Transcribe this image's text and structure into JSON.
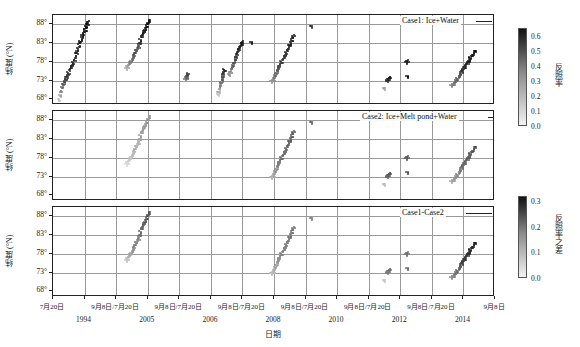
{
  "figure": {
    "xaxis_title": "日期",
    "yaxis_title": "纬度 (°N)"
  },
  "panels": [
    {
      "id": "panel-1",
      "label": "Case1: Ice+Water"
    },
    {
      "id": "panel-2",
      "label": "Case2: Ice+Melt pond+Water"
    },
    {
      "id": "panel-3",
      "label": "Case1-Case2"
    }
  ],
  "yticks": [
    "68°",
    "73°",
    "78°",
    "83°",
    "88°"
  ],
  "ytick_values": [
    68,
    73,
    78,
    83,
    88
  ],
  "xticks": [
    "7月20日",
    "9月8日",
    "7月20日",
    "9月8日",
    "7月20日",
    "9月8日",
    "7月20日",
    "9月8日",
    "7月20日",
    "9月8日",
    "7月20日",
    "9月8日",
    "7月20日",
    "9月8日"
  ],
  "xtick_groups": [
    "7月20日",
    "9月8日/7月20日",
    "9月8日/7月20日",
    "9月8日/7月20日",
    "9月8日/7月20日",
    "9月8日/7月20日",
    "9月8日/7月20日",
    "9月8日"
  ],
  "years": [
    "1994",
    "2005",
    "2006",
    "2008",
    "2010",
    "2012",
    "2014"
  ],
  "colorbars": [
    {
      "id": "colorbar-albedo",
      "title": "反照率",
      "ticks": [
        "0.0",
        "0.1",
        "0.2",
        "0.3",
        "0.4",
        "0.5",
        "0.6"
      ],
      "tick_values": [
        0.0,
        0.1,
        0.2,
        0.3,
        0.4,
        0.5,
        0.6
      ],
      "vmin": 0.0,
      "vmax": 0.65,
      "color_low": "#f2f2f2",
      "color_high": "#111111"
    },
    {
      "id": "colorbar-albedo-diff",
      "title": "反照率之差",
      "ticks": [
        "0.0",
        "0.1",
        "0.2",
        "0.3"
      ],
      "tick_values": [
        0.0,
        0.1,
        0.2,
        0.3
      ],
      "vmin": 0.0,
      "vmax": 0.32,
      "color_low": "#f2f2f2",
      "color_high": "#111111"
    }
  ],
  "chart_data": {
    "type": "scatter",
    "title": "",
    "xlabel": "日期",
    "ylabel": "纬度 (°N)",
    "ylim": [
      66.5,
      90.5
    ],
    "xlim": [
      0,
      14
    ],
    "grid": true,
    "legend_position": "inside-top-right",
    "colormap": "grayscale (light=low, dark=high)",
    "panels": [
      {
        "name": "Case1: Ice+Water",
        "colorbar": "反照率",
        "crange": [
          0.0,
          0.65
        ],
        "series": [
          {
            "name": "1994",
            "x": [
              0.28,
              0.33,
              0.38,
              0.45,
              0.52,
              0.58,
              0.64,
              0.7,
              0.76,
              0.82,
              0.88,
              0.94,
              1.0,
              1.06,
              1.12,
              1.18,
              1.24,
              1.3,
              1.36,
              1.42,
              1.48,
              1.54,
              1.6,
              1.66,
              1.72,
              1.78,
              1.84,
              1.9
            ],
            "y": [
              68.2,
              69.3,
              70.4,
              71.5,
              72.3,
              73.0,
              73.6,
              74.2,
              74.7,
              75.3,
              76.1,
              76.9,
              77.4,
              77.9,
              78.6,
              79.5,
              80.5,
              81.4,
              82.3,
              83.1,
              83.9,
              84.7,
              85.4,
              86.1,
              86.8,
              87.5,
              88.2,
              88.9
            ],
            "c": [
              0.14,
              0.22,
              0.3,
              0.38,
              0.44,
              0.48,
              0.5,
              0.52,
              0.53,
              0.55,
              0.56,
              0.57,
              0.57,
              0.58,
              0.58,
              0.59,
              0.6,
              0.6,
              0.61,
              0.61,
              0.62,
              0.62,
              0.63,
              0.63,
              0.63,
              0.64,
              0.64,
              0.64
            ]
          },
          {
            "name": "2005",
            "x": [
              4.02,
              4.08,
              4.14,
              4.2,
              4.26,
              4.32,
              4.38,
              4.44,
              4.5,
              4.56,
              4.62,
              4.68,
              4.74,
              4.8,
              4.86,
              4.92,
              4.98,
              5.04,
              5.1,
              5.16,
              5.22,
              5.28
            ],
            "y": [
              76.4,
              77.0,
              77.5,
              78.0,
              78.4,
              78.9,
              79.4,
              80.0,
              80.6,
              81.3,
              81.6,
              82.3,
              83.2,
              84.1,
              84.9,
              85.6,
              86.3,
              87.0,
              87.6,
              88.2,
              88.7,
              89.1
            ],
            "c": [
              0.2,
              0.24,
              0.28,
              0.31,
              0.34,
              0.37,
              0.4,
              0.44,
              0.47,
              0.5,
              0.42,
              0.48,
              0.55,
              0.58,
              0.6,
              0.61,
              0.62,
              0.63,
              0.63,
              0.64,
              0.64,
              0.65
            ]
          },
          {
            "name": "2006",
            "x": [
              7.3,
              7.34,
              7.38,
              7.42
            ],
            "y": [
              73.6,
              74.1,
              74.6,
              75.0
            ],
            "c": [
              0.36,
              0.42,
              0.47,
              0.5
            ]
          },
          {
            "name": "2008a",
            "x": [
              9.1,
              9.14,
              9.18,
              9.22,
              9.26,
              9.3,
              9.34,
              9.38,
              9.42,
              9.46
            ],
            "y": [
              69.4,
              70.3,
              71.2,
              72.0,
              72.8,
              73.5,
              74.2,
              74.9,
              75.6,
              76.2
            ],
            "c": [
              0.12,
              0.2,
              0.26,
              0.32,
              0.38,
              0.42,
              0.46,
              0.5,
              0.54,
              0.58
            ]
          },
          {
            "name": "2008b",
            "x": [
              9.72,
              9.78,
              9.84,
              9.9,
              9.96,
              10.02,
              10.08,
              10.14,
              10.2,
              10.26,
              10.32,
              10.38,
              10.44
            ],
            "y": [
              74.8,
              75.6,
              76.4,
              77.2,
              78.0,
              78.8,
              79.5,
              80.2,
              80.9,
              81.6,
              82.3,
              83.0,
              83.6
            ],
            "c": [
              0.3,
              0.34,
              0.38,
              0.42,
              0.46,
              0.49,
              0.52,
              0.55,
              0.57,
              0.59,
              0.6,
              0.61,
              0.62
            ]
          },
          {
            "name": "2008c",
            "x": [
              10.95
            ],
            "y": [
              83.4
            ],
            "c": [
              0.63
            ]
          },
          {
            "name": "2010",
            "x": [
              12.08,
              12.14,
              12.2,
              12.26,
              12.32,
              12.38,
              12.44,
              12.5,
              12.56,
              12.62,
              12.68,
              12.74,
              12.8,
              12.86,
              12.92,
              12.98,
              13.04,
              13.1,
              13.16,
              13.22,
              13.28
            ],
            "y": [
              72.9,
              73.5,
              74.1,
              74.7,
              75.3,
              75.9,
              76.5,
              77.1,
              77.7,
              78.3,
              78.9,
              79.5,
              80.1,
              80.7,
              81.3,
              81.9,
              82.5,
              83.1,
              83.8,
              84.5,
              85.2
            ],
            "c": [
              0.26,
              0.3,
              0.34,
              0.38,
              0.41,
              0.44,
              0.46,
              0.48,
              0.5,
              0.51,
              0.52,
              0.53,
              0.54,
              0.55,
              0.56,
              0.56,
              0.57,
              0.58,
              0.58,
              0.59,
              0.6
            ]
          },
          {
            "name": "2010b",
            "x": [
              14.3
            ],
            "y": [
              87.6
            ],
            "c": [
              0.52
            ]
          },
          {
            "name": "2012a",
            "x": [
              18.5,
              18.56,
              18.62
            ],
            "y": [
              73.1,
              73.6,
              74.1
            ],
            "c": [
              0.55,
              0.58,
              0.6
            ]
          },
          {
            "name": "2012b",
            "x": [
              19.55,
              19.58
            ],
            "y": [
              78.0,
              78.5
            ],
            "c": [
              0.58,
              0.61
            ]
          },
          {
            "name": "2012c",
            "x": [
              19.6
            ],
            "y": [
              74.2
            ],
            "c": [
              0.62
            ]
          },
          {
            "name": "2012d",
            "x": [
              18.3
            ],
            "y": [
              71.1
            ],
            "c": [
              0.22
            ]
          },
          {
            "name": "2014",
            "x": [
              22.05,
              22.12,
              22.2,
              22.28,
              22.36,
              22.44,
              22.52,
              22.6,
              22.68,
              22.76,
              22.84,
              22.92,
              23.0,
              23.08,
              23.16,
              23.24,
              23.32
            ],
            "y": [
              71.8,
              72.3,
              72.8,
              73.3,
              73.8,
              74.4,
              75.0,
              75.6,
              76.2,
              76.8,
              77.4,
              78.0,
              78.6,
              79.2,
              79.8,
              80.4,
              81.0
            ],
            "c": [
              0.3,
              0.34,
              0.37,
              0.4,
              0.43,
              0.46,
              0.49,
              0.52,
              0.54,
              0.56,
              0.58,
              0.59,
              0.6,
              0.61,
              0.62,
              0.63,
              0.64
            ]
          }
        ]
      },
      {
        "name": "Case2: Ice+Melt pond+Water",
        "colorbar": "反照率",
        "crange": [
          0.0,
          0.65
        ],
        "note": "no 1994 / 2006 / early-2008 tracks; 2005 track lighter"
      },
      {
        "name": "Case1-Case2",
        "colorbar": "反照率之差",
        "crange": [
          0.0,
          0.32
        ],
        "note": "difference field; same track geometry as Case1 where both exist"
      }
    ]
  }
}
